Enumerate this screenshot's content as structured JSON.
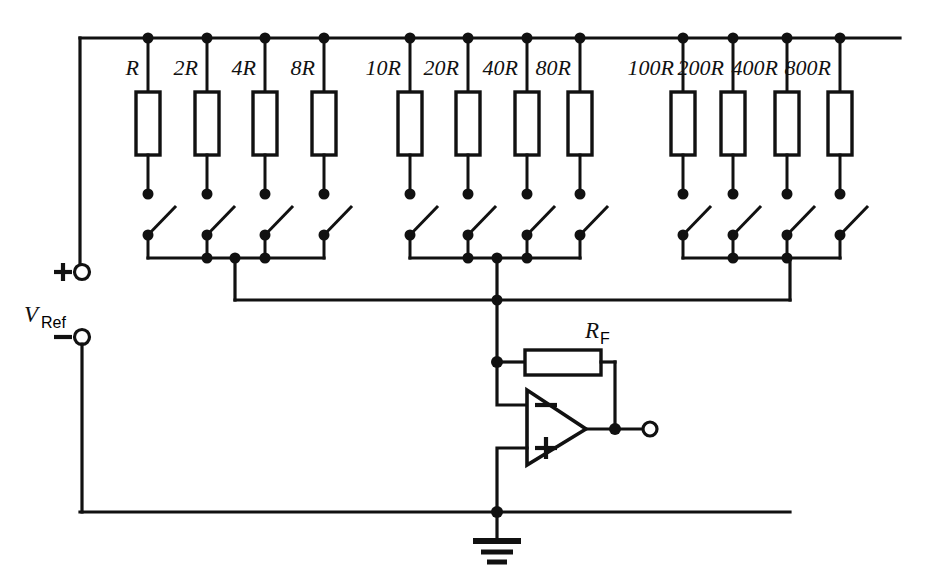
{
  "diagram": {
    "source_label": {
      "name": "V_Ref",
      "symbol": "V",
      "subscript": "Ref",
      "plus_terminal": "+",
      "minus_terminal": "−"
    },
    "feedback_resistor": {
      "symbol": "R",
      "subscript": "F",
      "name": "RF"
    },
    "opamp": {
      "inverting_label": "−",
      "noninverting_label": "+",
      "name": "summing-amplifier"
    },
    "ground": {
      "name": "ground-symbol"
    },
    "output": {
      "name": "output-terminal"
    },
    "groups": [
      {
        "name": "units-group",
        "resistors": [
          {
            "label": "R",
            "prefix": "",
            "base": "R",
            "x": 148
          },
          {
            "label": "2R",
            "prefix": "2",
            "base": "R",
            "x": 207
          },
          {
            "label": "4R",
            "prefix": "4",
            "base": "R",
            "x": 265
          },
          {
            "label": "8R",
            "prefix": "8",
            "base": "R",
            "x": 324
          }
        ],
        "bus_drop_x": 235
      },
      {
        "name": "tens-group",
        "resistors": [
          {
            "label": "10R",
            "prefix": "10",
            "base": "R",
            "x": 410
          },
          {
            "label": "20R",
            "prefix": "20",
            "base": "R",
            "x": 468
          },
          {
            "label": "40R",
            "prefix": "40",
            "base": "R",
            "x": 527
          },
          {
            "label": "80R",
            "prefix": "80",
            "base": "R",
            "x": 580
          }
        ],
        "bus_drop_x": 497
      },
      {
        "name": "hundreds-group",
        "resistors": [
          {
            "label": "100R",
            "prefix": "100",
            "base": "R",
            "x": 683
          },
          {
            "label": "200R",
            "prefix": "200",
            "base": "R",
            "x": 733
          },
          {
            "label": "400R",
            "prefix": "400",
            "base": "R",
            "x": 787
          },
          {
            "label": "800R",
            "prefix": "800",
            "base": "R",
            "x": 840
          }
        ],
        "bus_drop_x": 790
      }
    ],
    "colors": {
      "ink": "#111111",
      "paper": "#ffffff"
    }
  }
}
